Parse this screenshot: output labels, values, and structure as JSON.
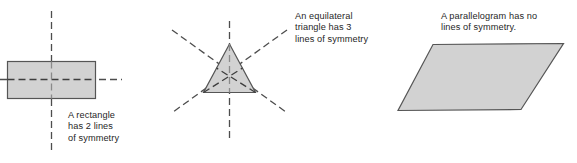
{
  "figure": {
    "background_color": "#ffffff"
  },
  "style": {
    "shape_fill": "#d2d2d2",
    "shape_stroke": "#555555",
    "symmetry_line_color": "#4d4d4d",
    "text_color": "#1f1f1f"
  },
  "shapes": [
    {
      "name": "rectangle",
      "fill": "#d2d2d2",
      "stroke": "#555555",
      "lines_of_symmetry": 2,
      "symmetry_line_orientations": [
        "vertical",
        "horizontal"
      ]
    },
    {
      "name": "equilateral-triangle",
      "fill": "#d2d2d2",
      "stroke": "#555555",
      "lines_of_symmetry": 3,
      "symmetry_line_orientations": [
        "vertical",
        "diagonal-left",
        "diagonal-right"
      ]
    },
    {
      "name": "parallelogram",
      "fill": "#d2d2d2",
      "stroke": "#555555",
      "lines_of_symmetry": 0,
      "symmetry_line_orientations": []
    }
  ],
  "captions": {
    "rectangle": {
      "line1": "A rectangle",
      "line2": "has 2 lines",
      "line3": "of symmetry"
    },
    "triangle": {
      "line1": "An equilateral",
      "line2": "triangle has 3",
      "line3": "lines of symmetry"
    },
    "parallelogram": {
      "line1": "A parallelogram has no",
      "line2": "lines of symmetry."
    }
  }
}
